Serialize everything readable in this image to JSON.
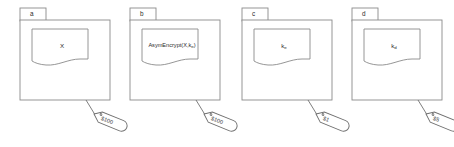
{
  "figure": {
    "type": "diagram",
    "background_color": "#ffffff",
    "stroke_color": "#8a8a8a",
    "text_color": "#2b2b2b"
  },
  "panels": [
    {
      "tab_label": "a",
      "doc_label": "X",
      "doc_label_html": "X",
      "price_tag": "$100",
      "name": "panel-a"
    },
    {
      "tab_label": "b",
      "doc_label": "AsymEncrypt(X,ke)",
      "doc_label_html": "AsymEncrypt(X,k<sub>e</sub>)",
      "price_tag": "$100",
      "name": "panel-b"
    },
    {
      "tab_label": "c",
      "doc_label": "ke",
      "doc_label_html": "k<sub>e</sub>",
      "price_tag": "$1",
      "name": "panel-c"
    },
    {
      "tab_label": "d",
      "doc_label": "kd",
      "doc_label_html": "k<sub>d</sub>",
      "price_tag": "$5",
      "name": "panel-d"
    }
  ]
}
